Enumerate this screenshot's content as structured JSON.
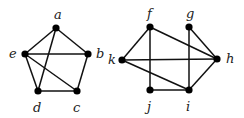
{
  "graphs": [
    {
      "name": "left-graph",
      "vertices": [
        {
          "id": "a",
          "x": 56,
          "y": 28,
          "lx": 54,
          "ly": 19
        },
        {
          "id": "b",
          "x": 88,
          "y": 54,
          "lx": 96,
          "ly": 58
        },
        {
          "id": "c",
          "x": 77,
          "y": 91,
          "lx": 73,
          "ly": 112
        },
        {
          "id": "d",
          "x": 38,
          "y": 91,
          "lx": 33,
          "ly": 112
        },
        {
          "id": "e",
          "x": 25,
          "y": 54,
          "lx": 9,
          "ly": 58
        }
      ],
      "edges": [
        [
          "a",
          "e"
        ],
        [
          "a",
          "b"
        ],
        [
          "a",
          "d"
        ],
        [
          "e",
          "b"
        ],
        [
          "e",
          "d"
        ],
        [
          "e",
          "c"
        ],
        [
          "b",
          "c"
        ],
        [
          "d",
          "c"
        ]
      ]
    },
    {
      "name": "right-graph",
      "vertices": [
        {
          "id": "f",
          "x": 150,
          "y": 27,
          "lx": 147,
          "ly": 18
        },
        {
          "id": "g",
          "x": 189,
          "y": 27,
          "lx": 186,
          "ly": 18
        },
        {
          "id": "h",
          "x": 217,
          "y": 59,
          "lx": 226,
          "ly": 63
        },
        {
          "id": "i",
          "x": 189,
          "y": 90,
          "lx": 186,
          "ly": 111
        },
        {
          "id": "j",
          "x": 150,
          "y": 90,
          "lx": 147,
          "ly": 111
        },
        {
          "id": "k",
          "x": 122,
          "y": 60,
          "lx": 108,
          "ly": 64
        }
      ],
      "edges": [
        [
          "f",
          "k"
        ],
        [
          "f",
          "h"
        ],
        [
          "f",
          "j"
        ],
        [
          "g",
          "i"
        ],
        [
          "g",
          "h"
        ],
        [
          "k",
          "h"
        ],
        [
          "k",
          "i"
        ],
        [
          "j",
          "i"
        ],
        [
          "i",
          "h"
        ]
      ]
    }
  ]
}
